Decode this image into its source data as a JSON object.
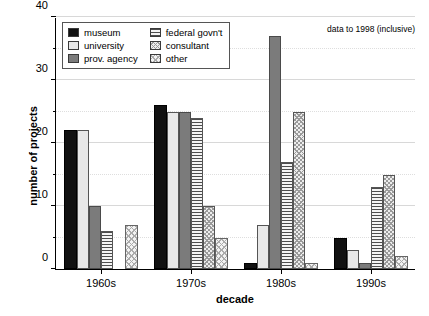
{
  "chart_data": {
    "type": "bar",
    "title": "",
    "subtitle": "",
    "xlabel": "decade",
    "ylabel": "number of projects",
    "categories": [
      "1960s",
      "1970s",
      "1980s",
      "1990s"
    ],
    "series": [
      {
        "name": "museum",
        "swatch": "solid-black",
        "values": [
          22,
          26,
          1,
          5
        ]
      },
      {
        "name": "university",
        "swatch": "solid-white",
        "values": [
          22,
          25,
          7,
          3
        ]
      },
      {
        "name": "prov. agency",
        "swatch": "solid-gray",
        "values": [
          10,
          25,
          37,
          1
        ]
      },
      {
        "name": "federal govn't",
        "swatch": "horizontal-lines",
        "values": [
          6,
          24,
          17,
          13
        ]
      },
      {
        "name": "consultant",
        "swatch": "dense-crosshatch",
        "values": [
          0,
          10,
          25,
          15
        ]
      },
      {
        "name": "other",
        "swatch": "light-crosshatch",
        "values": [
          7,
          5,
          1,
          2
        ]
      }
    ],
    "ylim": [
      0,
      40
    ],
    "y_major_ticks": [
      0,
      10,
      20,
      30,
      40
    ],
    "y_tick_labels": [
      "0",
      "10",
      "20",
      "30",
      "40"
    ],
    "y_minor_ticks": [
      5,
      15,
      25,
      35
    ],
    "grid": true,
    "legend_position": "top-left-inside",
    "annotations": [
      {
        "text": "data to 1998 (inclusive)",
        "position": "top-right-inside"
      }
    ]
  },
  "legend": {
    "entries": [
      {
        "label": "museum"
      },
      {
        "label": "federal govn't"
      },
      {
        "label": "university"
      },
      {
        "label": "consultant"
      },
      {
        "label": "prov. agency"
      },
      {
        "label": "other"
      }
    ]
  },
  "annotation": {
    "text": "data to 1998 (inclusive)"
  }
}
